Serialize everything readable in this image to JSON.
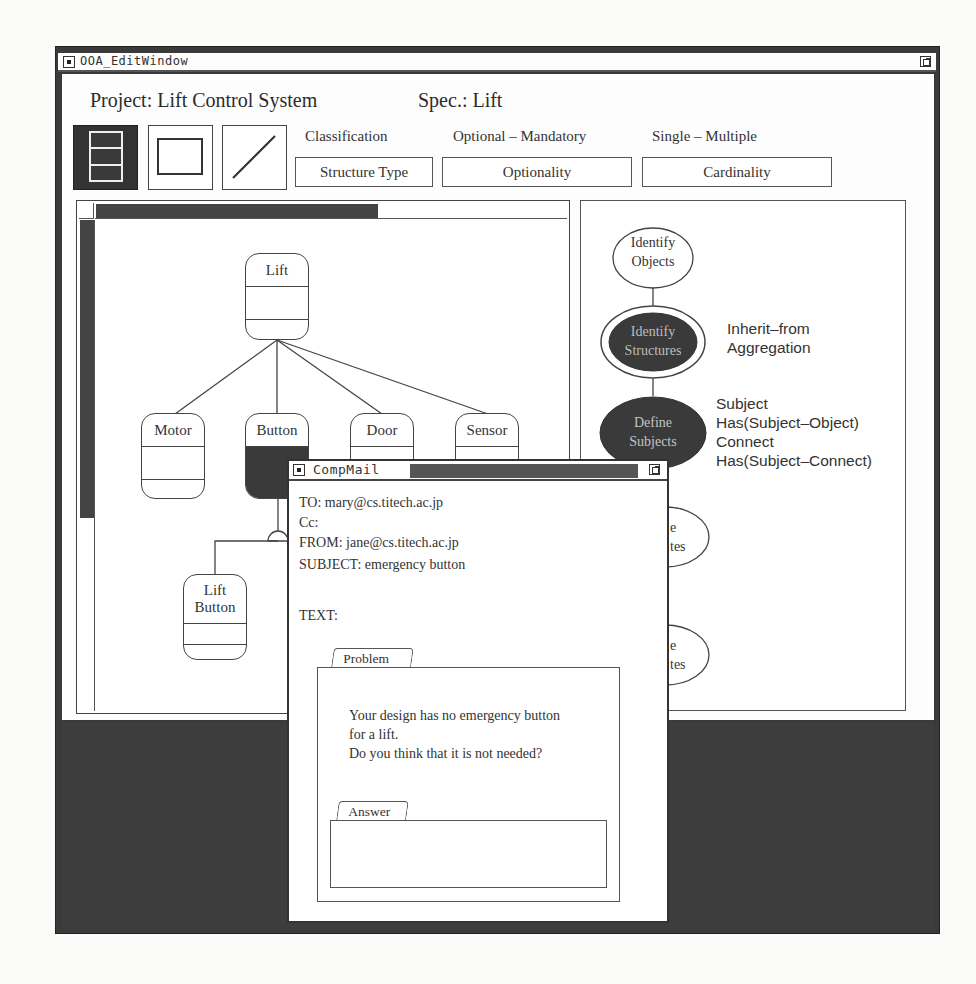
{
  "ooa_window": {
    "title": "OOA_EditWindow",
    "project_label": "Project: Lift Control System",
    "spec_label": "Spec.: Lift",
    "tools": [
      {
        "name": "class-object-tool",
        "selected": true
      },
      {
        "name": "rectangle-tool",
        "selected": false
      },
      {
        "name": "line-tool",
        "selected": false
      }
    ],
    "field_groups": [
      {
        "label": "Classification",
        "value": "Structure Type"
      },
      {
        "label": "Optional – Mandatory",
        "value": "Optionality"
      },
      {
        "label": "Single – Multiple",
        "value": "Cardinality"
      }
    ]
  },
  "diagram": {
    "nodes": [
      {
        "id": "lift",
        "label": "Lift"
      },
      {
        "id": "motor",
        "label": "Motor"
      },
      {
        "id": "button",
        "label": "Button",
        "selected": true
      },
      {
        "id": "door",
        "label": "Door"
      },
      {
        "id": "sensor",
        "label": "Sensor"
      },
      {
        "id": "lift-button",
        "label": "Lift Button"
      }
    ],
    "edges": [
      [
        "lift",
        "motor"
      ],
      [
        "lift",
        "button"
      ],
      [
        "lift",
        "door"
      ],
      [
        "lift",
        "sensor"
      ],
      [
        "button",
        "lift-button"
      ]
    ]
  },
  "process": {
    "steps": [
      {
        "label_line1": "Identify",
        "label_line2": "Objects",
        "state": "done"
      },
      {
        "label_line1": "Identify",
        "label_line2": "Structures",
        "state": "current"
      },
      {
        "label_line1": "Define",
        "label_line2": "Subjects",
        "state": "done-dark"
      },
      {
        "label_line1": "e",
        "label_line2": "tes",
        "state": "hidden-partial"
      },
      {
        "label_line1": "e",
        "label_line2": "tes",
        "state": "hidden-partial"
      }
    ],
    "annotations": {
      "structures": [
        "Inherit–from",
        "Aggregation"
      ],
      "subjects": [
        "Subject",
        "Has(Subject–Object)",
        "Connect",
        "Has(Subject–Connect)"
      ]
    }
  },
  "mail_window": {
    "title": "CompMail",
    "to": "TO: mary@cs.titech.ac.jp",
    "cc": "Cc:",
    "from": "FROM: jane@cs.titech.ac.jp",
    "subject": "SUBJECT: emergency button",
    "text_label": "TEXT:",
    "problem_tab": "Problem",
    "problem_lines": [
      "Your design has no emergency button",
      "for a lift.",
      "Do you think that it is not needed?"
    ],
    "answer_tab": "Answer",
    "answer_value": ""
  }
}
